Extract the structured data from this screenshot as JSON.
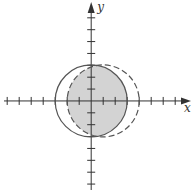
{
  "figure": {
    "x_axis_label": "x",
    "y_axis_label": "y",
    "x_ticks": [
      -7,
      -6,
      -5,
      -4,
      -3,
      -2,
      -1,
      1,
      2,
      3,
      4,
      5,
      6,
      7
    ],
    "y_ticks": [
      -7,
      -6,
      -5,
      -4,
      -3,
      -2,
      -1,
      1,
      2,
      3,
      4,
      5,
      6,
      7
    ],
    "x_range": [
      -7.6,
      8.4
    ],
    "y_range": [
      -7.5,
      8.5
    ],
    "curves": [
      {
        "name": "solid-circle",
        "center": [
          0,
          0
        ],
        "radius": 3,
        "style": "solid"
      },
      {
        "name": "dashed-circle",
        "center": [
          1,
          0
        ],
        "radius": 3,
        "style": "dashed"
      }
    ],
    "shaded_region": "intersection of the two disks",
    "colors": {
      "shade": "#d3d3d3",
      "stroke": "#555555",
      "axis": "#333333"
    }
  }
}
